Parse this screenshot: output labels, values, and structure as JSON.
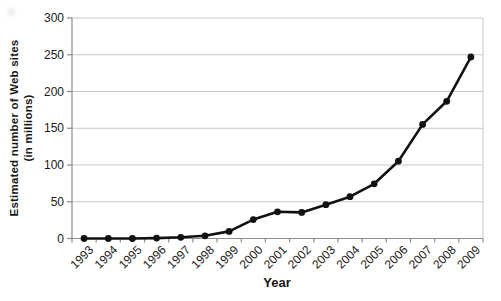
{
  "figure": {
    "y_axis_title_line1": "Estimated number of Web sites",
    "y_axis_title_line2": "(in millions)",
    "x_axis_title": "Year"
  },
  "chart_data": {
    "type": "line",
    "title": "",
    "xlabel": "Year",
    "ylabel": "Estimated number of Web sites (in millions)",
    "categories": [
      "1993",
      "1994",
      "1995",
      "1996",
      "1997",
      "1998",
      "1999",
      "2000",
      "2001",
      "2002",
      "2003",
      "2004",
      "2005",
      "2006",
      "2007",
      "2008",
      "2009"
    ],
    "series": [
      {
        "name": "Estimated number of Web sites",
        "values": [
          0,
          0,
          0,
          0.6,
          1.7,
          3.7,
          9.6,
          25.7,
          36.3,
          35.5,
          46,
          56.9,
          74.4,
          105.2,
          155.2,
          186.7,
          247
        ]
      }
    ],
    "ylim": [
      0,
      300
    ],
    "y_ticks": [
      0,
      50,
      100,
      150,
      200,
      250,
      300
    ],
    "grid": true,
    "legend_position": "none",
    "marker": "circle",
    "line_color": "#111111",
    "marker_color": "#111111",
    "grid_color": "#c8c8c8",
    "axis_color": "#8c8c8c",
    "tick_label_color": "#1a1a1a",
    "background_color": "#ffffff"
  }
}
